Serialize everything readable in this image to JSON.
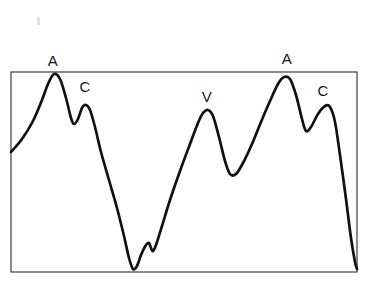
{
  "figure": {
    "background_color": "#ffffff",
    "trace_color": "#111111",
    "frame_color": "#2b2b2b",
    "frame": {
      "x": 11,
      "y": 72,
      "width": 346,
      "height": 200
    },
    "labels": [
      {
        "id": "a-wave-1",
        "text": "A",
        "x": 53,
        "y": 60
      },
      {
        "id": "c-wave-1",
        "text": "C",
        "x": 85,
        "y": 86
      },
      {
        "id": "v-wave-1",
        "text": "V",
        "x": 207,
        "y": 96
      },
      {
        "id": "a-wave-2",
        "text": "A",
        "x": 287,
        "y": 58
      },
      {
        "id": "c-wave-2",
        "text": "C",
        "x": 323,
        "y": 90
      }
    ],
    "artifact": {
      "x": 37,
      "y": 17
    }
  },
  "chart_data": {
    "type": "line",
    "xlabel": "",
    "ylabel": "",
    "grid": false,
    "legend": false,
    "axis_ticks": false,
    "xlim": [
      11,
      357
    ],
    "ylim": [
      272,
      72
    ],
    "annotations": [
      {
        "label": "A",
        "x": 53,
        "y": 60,
        "meaning": "a wave peak, first beat"
      },
      {
        "label": "C",
        "x": 85,
        "y": 86,
        "meaning": "c wave peak, first beat"
      },
      {
        "label": "V",
        "x": 207,
        "y": 96,
        "meaning": "v wave peak"
      },
      {
        "label": "A",
        "x": 287,
        "y": 58,
        "meaning": "a wave peak, second beat"
      },
      {
        "label": "C",
        "x": 323,
        "y": 90,
        "meaning": "c wave peak, second beat"
      }
    ],
    "series": [
      {
        "name": "jugular-venous-pressure",
        "color": "#111111",
        "points": [
          [
            11,
            152
          ],
          [
            22,
            139
          ],
          [
            33,
            121
          ],
          [
            42,
            100
          ],
          [
            48,
            84
          ],
          [
            54,
            74
          ],
          [
            60,
            79
          ],
          [
            66,
            98
          ],
          [
            71,
            118
          ],
          [
            74,
            124
          ],
          [
            78,
            119
          ],
          [
            82,
            108
          ],
          [
            86,
            105
          ],
          [
            90,
            110
          ],
          [
            95,
            127
          ],
          [
            101,
            152
          ],
          [
            109,
            180
          ],
          [
            117,
            208
          ],
          [
            124,
            236
          ],
          [
            129,
            258
          ],
          [
            133,
            269
          ],
          [
            137,
            266
          ],
          [
            141,
            255
          ],
          [
            146,
            245
          ],
          [
            149,
            243
          ],
          [
            151,
            248
          ],
          [
            153,
            251
          ],
          [
            156,
            245
          ],
          [
            162,
            226
          ],
          [
            170,
            200
          ],
          [
            180,
            171
          ],
          [
            190,
            144
          ],
          [
            198,
            123
          ],
          [
            203,
            113
          ],
          [
            208,
            110
          ],
          [
            213,
            116
          ],
          [
            219,
            137
          ],
          [
            225,
            161
          ],
          [
            230,
            174
          ],
          [
            236,
            174
          ],
          [
            243,
            163
          ],
          [
            252,
            144
          ],
          [
            261,
            122
          ],
          [
            270,
            101
          ],
          [
            278,
            84
          ],
          [
            284,
            77
          ],
          [
            290,
            79
          ],
          [
            296,
            95
          ],
          [
            302,
            119
          ],
          [
            306,
            131
          ],
          [
            311,
            127
          ],
          [
            318,
            114
          ],
          [
            325,
            106
          ],
          [
            330,
            107
          ],
          [
            335,
            122
          ],
          [
            340,
            155
          ],
          [
            346,
            199
          ],
          [
            351,
            238
          ],
          [
            355,
            262
          ],
          [
            357,
            269
          ]
        ]
      }
    ]
  }
}
